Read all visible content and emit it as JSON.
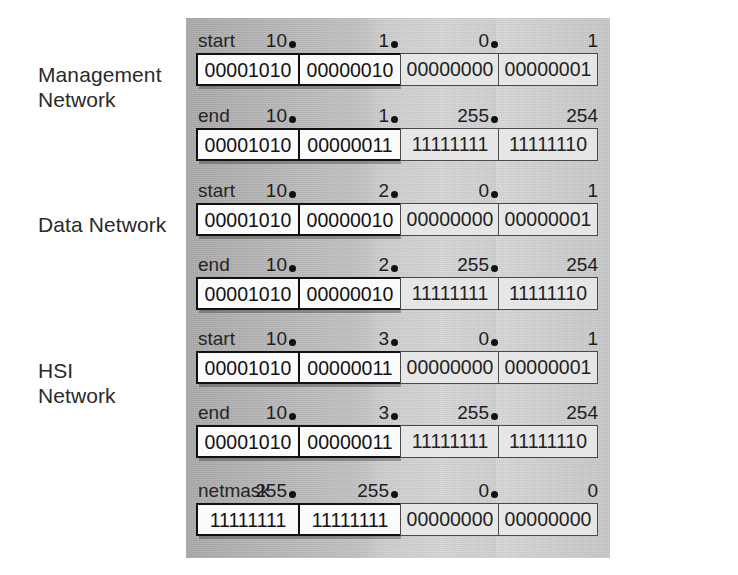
{
  "diagram": {
    "networks": [
      {
        "label": "Management\nNetwork",
        "rows": [
          {
            "caption": "start",
            "decimals": [
              "10",
              "1",
              "0",
              "1"
            ],
            "dots": [
              true,
              true,
              true,
              false
            ],
            "octets": [
              "00001010",
              "00000010",
              "00000000",
              "00000001"
            ]
          },
          {
            "caption": "end",
            "decimals": [
              "10",
              "1",
              "255",
              "254"
            ],
            "dots": [
              true,
              true,
              true,
              false
            ],
            "octets": [
              "00001010",
              "00000011",
              "11111111",
              "11111110"
            ]
          }
        ]
      },
      {
        "label": "Data Network",
        "rows": [
          {
            "caption": "start",
            "decimals": [
              "10",
              "2",
              "0",
              "1"
            ],
            "dots": [
              true,
              true,
              true,
              false
            ],
            "octets": [
              "00001010",
              "00000010",
              "00000000",
              "00000001"
            ]
          },
          {
            "caption": "end",
            "decimals": [
              "10",
              "2",
              "255",
              "254"
            ],
            "dots": [
              true,
              true,
              true,
              false
            ],
            "octets": [
              "00001010",
              "00000010",
              "11111111",
              "11111110"
            ]
          }
        ]
      },
      {
        "label": "HSI\nNetwork",
        "rows": [
          {
            "caption": "start",
            "decimals": [
              "10",
              "3",
              "0",
              "1"
            ],
            "dots": [
              true,
              true,
              true,
              false
            ],
            "octets": [
              "00001010",
              "00000011",
              "00000000",
              "00000001"
            ]
          },
          {
            "caption": "end",
            "decimals": [
              "10",
              "3",
              "255",
              "254"
            ],
            "dots": [
              true,
              true,
              true,
              false
            ],
            "octets": [
              "00001010",
              "00000011",
              "11111111",
              "11111110"
            ]
          }
        ]
      },
      {
        "label": "",
        "rows": [
          {
            "caption": "netmask",
            "decimals": [
              "255",
              "255",
              "0",
              "0"
            ],
            "dots": [
              true,
              true,
              true,
              false
            ],
            "octets": [
              "11111111",
              "11111111",
              "00000000",
              "00000000"
            ]
          }
        ]
      }
    ],
    "colors": {
      "box_border_network": "#111111",
      "box_fill_network": "#fbfbfb",
      "box_border_host": "#4a4a4a",
      "box_fill_host": "#e6e6e6",
      "text": "#1d1d1d",
      "background_band": "#cfcfcf"
    }
  }
}
